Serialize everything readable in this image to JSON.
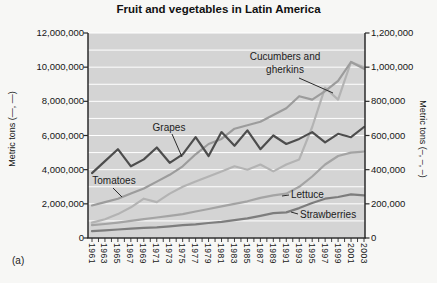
{
  "figure": {
    "title": "Fruit and vegetables in Latin America",
    "subfigure_label": "(a)",
    "left_axis_label": "Metric tons (—, —)",
    "right_axis_label": "Metric tons (–, –, –)"
  },
  "chart_data": {
    "type": "line",
    "title": "Fruit and vegetables in Latin America",
    "xlabel": "",
    "x": [
      1961,
      1963,
      1965,
      1967,
      1969,
      1971,
      1973,
      1975,
      1977,
      1979,
      1981,
      1983,
      1985,
      1987,
      1989,
      1991,
      1993,
      1995,
      1997,
      1999,
      2001,
      2003
    ],
    "x_tick_labels": [
      "1961",
      "1963",
      "1965",
      "1967",
      "1969",
      "1971",
      "1973",
      "1975",
      "1977",
      "1979",
      "1981",
      "1983",
      "1985",
      "1987",
      "1989",
      "1991",
      "1993",
      "1995",
      "1997",
      "1999",
      "2001",
      "2003"
    ],
    "grid": true,
    "plot_bg_color": "#d4d4d4",
    "grid_color": "#ffffff",
    "axis_color": "#2b2b2b",
    "left_axis": {
      "label": "Metric tons (—, —)",
      "range": [
        0,
        12000000
      ],
      "tick_step": 2000000,
      "tick_labels": [
        "12,000,000",
        "10,000,000",
        "8,000,000",
        "6,000,000",
        "4,000,000",
        "2,000,000",
        "0"
      ]
    },
    "right_axis": {
      "label": "Metric tons (–, –, –)",
      "range": [
        0,
        1200000
      ],
      "tick_step": 200000,
      "tick_labels": [
        "1,200,000",
        "1,000,000",
        "800,000",
        "600,000",
        "400,000",
        "200,000",
        "0"
      ]
    },
    "series": [
      {
        "name": "Cucumbers and gherkins",
        "axis": "right",
        "color": "#b3b3b3",
        "values": [
          90000,
          110000,
          140000,
          180000,
          230000,
          210000,
          260000,
          300000,
          330000,
          360000,
          390000,
          420000,
          400000,
          430000,
          390000,
          430000,
          460000,
          650000,
          880000,
          810000,
          1030000,
          1000000
        ]
      },
      {
        "name": "Lettuce",
        "axis": "right",
        "color": "#a4a4a4",
        "values": [
          75000,
          82000,
          90000,
          100000,
          110000,
          120000,
          130000,
          140000,
          155000,
          170000,
          185000,
          200000,
          215000,
          235000,
          250000,
          260000,
          300000,
          360000,
          430000,
          480000,
          500000,
          505000
        ]
      },
      {
        "name": "Strawberries",
        "axis": "right",
        "color": "#7d7d7d",
        "values": [
          40000,
          45000,
          50000,
          55000,
          60000,
          62000,
          68000,
          75000,
          80000,
          88000,
          95000,
          105000,
          115000,
          130000,
          145000,
          150000,
          175000,
          205000,
          230000,
          240000,
          255000,
          250000
        ]
      },
      {
        "name": "Tomatoes",
        "axis": "left",
        "color": "#9c9c9c",
        "values": [
          1900000,
          2100000,
          2300000,
          2600000,
          2900000,
          3300000,
          3700000,
          4200000,
          4900000,
          5500000,
          5800000,
          6400000,
          6600000,
          6800000,
          7200000,
          7600000,
          8300000,
          8100000,
          8600000,
          9200000,
          10300000,
          9900000
        ]
      },
      {
        "name": "Grapes",
        "axis": "left",
        "color": "#4d4d4d",
        "values": [
          3800000,
          4500000,
          5200000,
          4200000,
          4600000,
          5300000,
          4400000,
          4900000,
          5900000,
          4800000,
          6200000,
          5400000,
          6300000,
          5200000,
          6000000,
          5500000,
          5800000,
          6200000,
          5600000,
          6100000,
          5900000,
          6500000
        ]
      }
    ],
    "annotations": [
      {
        "text": "Cucumbers and gherkins",
        "pos": {
          "left": 237,
          "top": 51,
          "width": 96,
          "align": "center"
        },
        "pointer": [
          299,
          78,
          333,
          93
        ]
      },
      {
        "text": "Grapes",
        "pos": {
          "left": 146,
          "top": 122,
          "width": 46,
          "align": "center"
        },
        "pointer": [
          172,
          134,
          182,
          157
        ]
      },
      {
        "text": "Tomatoes",
        "pos": {
          "left": 86,
          "top": 175,
          "width": 56,
          "align": "center"
        },
        "pointer": [
          113,
          188,
          122,
          197
        ]
      },
      {
        "text": "Lettuce",
        "pos": {
          "left": 291,
          "top": 189,
          "width": 44,
          "align": "left"
        },
        "pointer": [
          289,
          195,
          282,
          196
        ]
      },
      {
        "text": "Strawberries",
        "pos": {
          "left": 300,
          "top": 209,
          "width": 72,
          "align": "left"
        },
        "pointer": [
          298,
          214,
          291,
          212
        ]
      }
    ],
    "layout": {
      "plot_box": {
        "x0": 88,
        "y0": 33,
        "x1": 365,
        "y1": 238
      },
      "legend": "none (direct line labels)"
    }
  }
}
